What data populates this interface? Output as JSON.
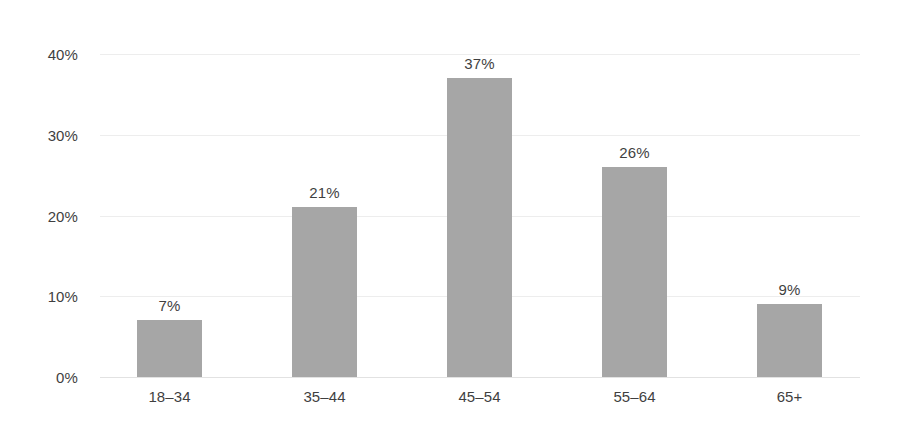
{
  "chart_data": {
    "type": "bar",
    "title": "",
    "subtitle": "",
    "xlabel": "",
    "ylabel": "",
    "categories": [
      "18–34",
      "35–44",
      "45–54",
      "55–64",
      "65+"
    ],
    "values": [
      7,
      21,
      37,
      26,
      9
    ],
    "value_labels": [
      "7%",
      "21%",
      "37%",
      "26%",
      "9%"
    ],
    "ylim": [
      0,
      40
    ],
    "yticks": [
      0,
      10,
      20,
      30,
      40
    ],
    "ytick_labels": [
      "0%",
      "10%",
      "20%",
      "30%",
      "40%"
    ],
    "grid": true,
    "grid_axis": "y",
    "legend": false,
    "legend_position": "none",
    "series": [
      {
        "name": "Share of respondents",
        "values": [
          7,
          21,
          37,
          26,
          9
        ]
      }
    ],
    "annotations": []
  },
  "style": {
    "bar_color": "#a6a6a6",
    "grid_color": "#ededed",
    "baseline_color": "#e2e2e2",
    "text_color": "#3f3f3f",
    "background_color": "#ffffff"
  }
}
